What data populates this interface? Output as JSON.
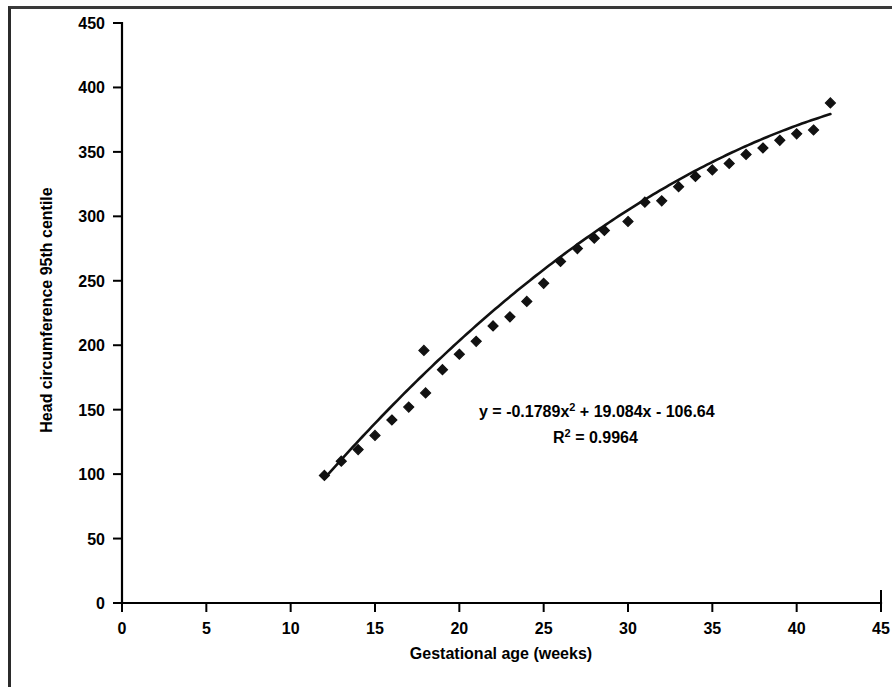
{
  "chart_data": {
    "type": "scatter",
    "title": "",
    "subtitle": "",
    "xlabel": "Gestational age (weeks)",
    "ylabel": "Head circumference 95th centile",
    "xlim": [
      0,
      45
    ],
    "ylim": [
      0,
      450
    ],
    "xticks": [
      0,
      5,
      10,
      15,
      20,
      25,
      30,
      35,
      40,
      45
    ],
    "yticks": [
      0,
      50,
      100,
      150,
      200,
      250,
      300,
      350,
      400,
      450
    ],
    "xtick_labels": [
      "0",
      "5",
      "10",
      "15",
      "20",
      "25",
      "30",
      "35",
      "40",
      "45"
    ],
    "ytick_labels": [
      "0",
      "50",
      "100",
      "150",
      "200",
      "250",
      "300",
      "350",
      "400",
      "450"
    ],
    "grid": false,
    "legend": false,
    "legend_position": "none",
    "marker_style": "filled diamond",
    "marker_color": "#111111",
    "line_color": "#111111",
    "series": [
      {
        "name": "Head circumference 95th centile",
        "x": [
          12,
          13,
          14,
          15,
          16,
          17,
          17.9,
          18,
          19,
          20,
          21,
          22,
          23,
          24,
          25,
          26,
          27,
          28,
          28.6,
          30,
          31,
          32,
          33,
          34,
          35,
          36,
          37,
          38,
          39,
          40,
          41,
          42
        ],
        "y": [
          99,
          110,
          119,
          130,
          142,
          152,
          196,
          163,
          181,
          193,
          203,
          215,
          222,
          234,
          248,
          265,
          275,
          283,
          289,
          296,
          311,
          312,
          323,
          331,
          336,
          341,
          348,
          353,
          359,
          364,
          367,
          388
        ]
      }
    ],
    "trendline": {
      "type": "polynomial",
      "order": 2,
      "equation": "y = -0.1789x² + 19.084x - 106.64",
      "coefficients": [
        -0.1789,
        19.084,
        -106.64
      ],
      "r_squared": 0.9964,
      "x_start": 12,
      "x_end": 42
    },
    "annotations": [
      {
        "name": "equation-label",
        "prefix": "y = -0.1789x",
        "sup": "2",
        "suffix": " + 19.084x - 106.64",
        "x_px": 479,
        "y_px": 417
      },
      {
        "name": "r-squared-label",
        "prefix": "R",
        "sup": "2",
        "suffix": " = 0.9964",
        "x_px": 553,
        "y_px": 443
      }
    ]
  },
  "figure": {
    "background_color": "#ffffff",
    "foreground_color": "#111111",
    "border_color": "#2b2b2b"
  }
}
